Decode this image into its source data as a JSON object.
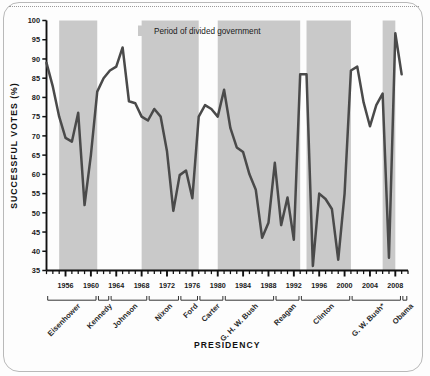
{
  "chart_data": {
    "type": "line",
    "title": "",
    "xlabel": "PRESIDENCY",
    "ylabel": "SUCCESSFUL VOTES (%)",
    "ylim": [
      35,
      100
    ],
    "xlim": [
      1953,
      2010
    ],
    "ytick_labels": [
      "100",
      "95",
      "90",
      "85",
      "80",
      "75",
      "70",
      "65",
      "60",
      "55",
      "50",
      "45",
      "40",
      "35"
    ],
    "ytick_values": [
      100,
      95,
      90,
      85,
      80,
      75,
      70,
      65,
      60,
      55,
      50,
      45,
      40,
      35
    ],
    "xtick_labels": [
      "1956",
      "1960",
      "1964",
      "1968",
      "1972",
      "1976",
      "1980",
      "1984",
      "1988",
      "1992",
      "1996",
      "2000",
      "2004",
      "2008"
    ],
    "xtick_values": [
      1956,
      1960,
      1964,
      1968,
      1972,
      1976,
      1980,
      1984,
      1988,
      1992,
      1996,
      2000,
      2004,
      2008
    ],
    "minor_tick_interval": 1,
    "grid": false,
    "legend_position": "top-center",
    "line_color": "#4a4a4a",
    "shade_color": "#c9c9c9",
    "legend": [
      {
        "label": "Period of divided government",
        "swatch_color": "#c9c9c9",
        "type": "shaded-band"
      }
    ],
    "series": [
      {
        "name": "Successful votes (%)",
        "x": [
          1953,
          1954,
          1955,
          1956,
          1957,
          1958,
          1959,
          1960,
          1961,
          1962,
          1963,
          1964,
          1965,
          1966,
          1967,
          1968,
          1969,
          1970,
          1971,
          1972,
          1973,
          1974,
          1975,
          1976,
          1977,
          1978,
          1979,
          1980,
          1981,
          1982,
          1983,
          1984,
          1985,
          1986,
          1987,
          1988,
          1989,
          1990,
          1991,
          1992,
          1993,
          1994,
          1995,
          1996,
          1997,
          1998,
          1999,
          2000,
          2001,
          2002,
          2003,
          2004,
          2005,
          2006,
          2007,
          2008,
          2009
        ],
        "values": [
          89.0,
          82.8,
          75.0,
          69.5,
          68.5,
          76.0,
          52.0,
          65.0,
          81.5,
          85.0,
          87.0,
          88.0,
          93.0,
          79.0,
          78.5,
          75.0,
          74.0,
          77.0,
          75.0,
          66.0,
          50.5,
          59.8,
          61.0,
          53.8,
          75.0,
          78.0,
          77.0,
          75.0,
          82.0,
          72.0,
          67.0,
          65.8,
          60.0,
          56.0,
          43.5,
          47.4,
          63.0,
          46.8,
          54.0,
          43.0,
          86.0,
          86.0,
          36.2,
          55.0,
          53.6,
          51.0,
          37.8,
          55.0,
          87.0,
          88.0,
          78.7,
          72.5,
          78.0,
          81.0,
          38.3,
          96.7,
          86.0
        ]
      }
    ],
    "shaded_bands": [
      {
        "label": "divided government",
        "start": 1955,
        "end": 1961
      },
      {
        "label": "divided government",
        "start": 1968,
        "end": 1977
      },
      {
        "label": "divided government",
        "start": 1980,
        "end": 1993
      },
      {
        "label": "divided government",
        "start": 1994,
        "end": 2001
      },
      {
        "label": "divided government",
        "start": 2006,
        "end": 2008
      }
    ],
    "presidencies": [
      {
        "name": "Eisenhower",
        "start": 1953,
        "end": 1961
      },
      {
        "name": "Kennedy",
        "start": 1961,
        "end": 1963
      },
      {
        "name": "Johnson",
        "start": 1963,
        "end": 1969
      },
      {
        "name": "Nixon",
        "start": 1969,
        "end": 1974
      },
      {
        "name": "Ford",
        "start": 1974,
        "end": 1977
      },
      {
        "name": "Carter",
        "start": 1977,
        "end": 1981
      },
      {
        "name": "G. H. W. Bush",
        "start": 1981,
        "end": 1989
      },
      {
        "name": "Reagan",
        "start": 1989,
        "end": 1993
      },
      {
        "name": "Clinton",
        "start": 1993,
        "end": 2001
      },
      {
        "name": "G. W. Bush*",
        "start": 2001,
        "end": 2009
      },
      {
        "name": "Obama",
        "start": 2009,
        "end": 2010
      }
    ]
  },
  "figure": {
    "ylabel": "SUCCESSFUL VOTES (%)",
    "xlabel": "PRESIDENCY",
    "legend_label": "Period of divided government"
  }
}
